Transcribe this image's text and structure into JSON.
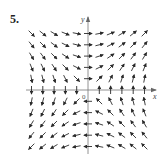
{
  "figure": {
    "problem_number": "5.",
    "x_axis_label": "x",
    "y_axis_label": "y",
    "origin_label": "0"
  },
  "chart_data": {
    "type": "direction_field",
    "title": "5.",
    "xlabel": "x",
    "ylabel": "y",
    "origin_label": "0",
    "grid": {
      "x_values": [
        -5,
        -4,
        -3,
        -2,
        -1,
        0,
        1,
        2,
        3,
        4,
        5
      ],
      "y_values": [
        -5,
        -4,
        -3,
        -2,
        -1,
        0,
        1,
        2,
        3,
        4,
        5
      ]
    },
    "vector_field": {
      "dx": "y",
      "dy": "x",
      "normalized": true
    },
    "quadrant_directions": {
      "Q1": "up-right",
      "Q2": "down-right",
      "Q3": "down-left",
      "Q4": "up-left",
      "positive_x_axis": "up",
      "negative_x_axis": "down",
      "positive_y_axis": "right",
      "negative_y_axis": "left"
    },
    "layout": {
      "origin_px": [
        88,
        90
      ],
      "spacing_px": 11.3,
      "arrow_length_px": 8,
      "color": "#2a2a2a",
      "axis_color": "#777777"
    }
  }
}
